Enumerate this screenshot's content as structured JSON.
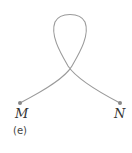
{
  "figure": {
    "caption": "(e)",
    "points": [
      {
        "label": "M",
        "x": 20,
        "y": 103
      },
      {
        "label": "N",
        "x": 120,
        "y": 103
      }
    ],
    "curve_color": "#9a9a9a",
    "point_color": "#888888"
  }
}
